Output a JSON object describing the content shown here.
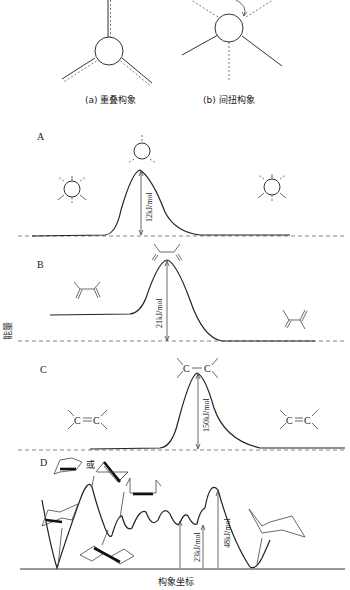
{
  "figure_top": {
    "caption_a": "(a) 重叠构象",
    "caption_b": "(b) 间扭构象"
  },
  "panels": [
    {
      "id": "A",
      "label": "A",
      "barrier": "12kJ/mol"
    },
    {
      "id": "B",
      "label": "B",
      "barrier": "21kJ/mol"
    },
    {
      "id": "C",
      "label": "C",
      "barrier": "150kJ/mol",
      "molecule_label_c1": "C",
      "molecule_label_c2": "C"
    },
    {
      "id": "D",
      "label": "D",
      "or_text": "或",
      "barriers": [
        "28kJ/mol",
        "23kJ/mol",
        "48kJ/mol"
      ]
    }
  ],
  "axes": {
    "y_label": "能量",
    "x_label": "构象坐标"
  },
  "colors": {
    "line": "#222222",
    "background": "#ffffff"
  }
}
